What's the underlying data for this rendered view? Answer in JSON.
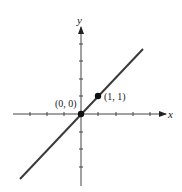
{
  "diagram": {
    "axes": {
      "x_label": "x",
      "y_label": "y"
    },
    "points": [
      {
        "label": "(0, 0)",
        "x": 0,
        "y": 0
      },
      {
        "label": "(1, 1)",
        "x": 1,
        "y": 1
      }
    ],
    "line": {
      "equation": "y = x",
      "color": "#3a3a3a"
    }
  }
}
